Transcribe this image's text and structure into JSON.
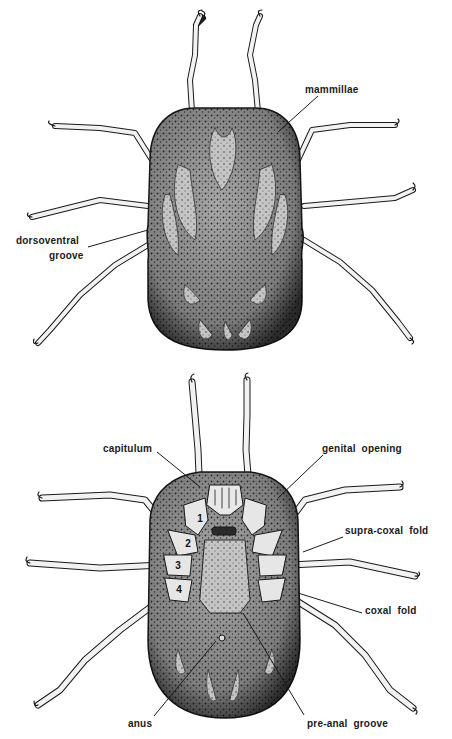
{
  "figure": {
    "views": [
      {
        "name": "dorsal",
        "labels": [
          {
            "id": "mammillae",
            "text": "mammillae",
            "x": 305,
            "y": 84,
            "leader": [
              318,
              96,
              278,
              132
            ]
          },
          {
            "id": "dorsoventral-groove",
            "lines": [
              "dorsoventral",
              "groove"
            ],
            "x": 16,
            "y": 235,
            "leader": [
              88,
              247,
              148,
              230
            ]
          }
        ]
      },
      {
        "name": "ventral",
        "labels": [
          {
            "id": "capitulum",
            "text": "capitulum",
            "x": 103,
            "y": 443,
            "leader": [
              157,
              452,
              200,
              487
            ]
          },
          {
            "id": "genital-opening",
            "text": "genital  opening",
            "x": 322,
            "y": 443,
            "leader": [
              323,
              455,
              278,
              498
            ]
          },
          {
            "id": "supra-coxal-fold",
            "text": "supra-coxal  fold",
            "x": 345,
            "y": 525,
            "leader": [
              343,
              537,
              303,
              552
            ]
          },
          {
            "id": "coxal-fold",
            "text": "coxal  fold",
            "x": 365,
            "y": 605,
            "leader": [
              362,
              613,
              298,
              593
            ]
          },
          {
            "id": "anus",
            "text": "anus",
            "x": 128,
            "y": 718,
            "leader": [
              154,
              716,
              216,
              641
            ]
          },
          {
            "id": "pre-anal-groove",
            "text": "pre-anal  groove",
            "x": 307,
            "y": 718,
            "leader": [
              304,
              715,
              243,
              613
            ]
          }
        ],
        "coxae": [
          {
            "n": "1",
            "x": 195,
            "y": 513
          },
          {
            "n": "2",
            "x": 183,
            "y": 538
          },
          {
            "n": "3",
            "x": 173,
            "y": 560
          },
          {
            "n": "4",
            "x": 174,
            "y": 584
          }
        ]
      }
    ],
    "colors": {
      "ink": "#1a1a1a",
      "body_fill": "#8a8a8a",
      "body_dark": "#3a3a3a",
      "leg_fill": "#f2f2f2",
      "background": "#ffffff"
    }
  }
}
